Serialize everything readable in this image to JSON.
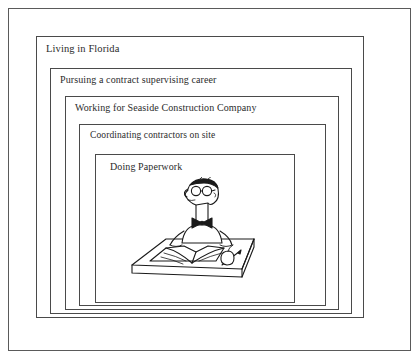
{
  "diagram": {
    "type": "nested-boxes",
    "title": "",
    "frame": {
      "border_color": "#5a5a5a",
      "background_color": "#ffffff"
    },
    "levels": [
      {
        "index": 1,
        "label": "Living in Florida"
      },
      {
        "index": 2,
        "label": "Pursuing a contract supervising career"
      },
      {
        "index": 3,
        "label": "Working for Seaside Construction Company"
      },
      {
        "index": 4,
        "label": "Coordinating contractors on site"
      },
      {
        "index": 5,
        "label": "Doing Paperwork"
      }
    ],
    "illustration": {
      "name": "man-doing-paperwork",
      "style": "black-and-white line drawing",
      "elements": [
        "man with glasses",
        "bow tie",
        "short hair",
        "desk",
        "open book",
        "pen",
        "apple"
      ],
      "line_color": "#1a1a1a"
    },
    "text_color": "#2b2b2b"
  }
}
